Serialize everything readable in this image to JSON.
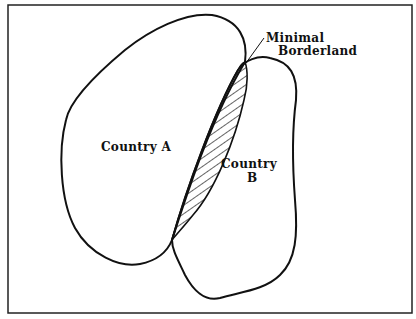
{
  "diagram": {
    "title": "",
    "labels": {
      "country_a": "Country A",
      "country_b_line1": "Country",
      "country_b_line2": "B",
      "callout_line1": "Minimal",
      "callout_line2": "Borderland"
    },
    "regions": [
      {
        "id": "country-a",
        "name": "Country A"
      },
      {
        "id": "country-b",
        "name": "Country B"
      },
      {
        "id": "borderland",
        "name": "Minimal Borderland",
        "fill": "hatched"
      }
    ],
    "colors": {
      "stroke": "#111111",
      "background": "#ffffff"
    }
  }
}
